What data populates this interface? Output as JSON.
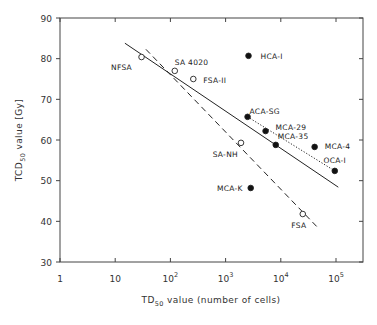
{
  "chart_data": {
    "type": "scatter",
    "title": "",
    "xlabel": "TD50 value (number of cells)",
    "xlabel_main": "TD",
    "xlabel_sub": "50",
    "xlabel_rest": " value (number of cells)",
    "ylabel": "TCD50 value [Gy]",
    "ylabel_main": "TCD",
    "ylabel_sub": "50",
    "ylabel_rest": " value   [Gy]",
    "xscale": "log",
    "xlim": [
      1,
      250000
    ],
    "ylim": [
      30,
      90
    ],
    "grid": false,
    "x_ticks": [
      {
        "value": 1,
        "label": "1",
        "exp": ""
      },
      {
        "value": 10,
        "label": "10",
        "exp": ""
      },
      {
        "value": 100,
        "label": "10",
        "exp": "2"
      },
      {
        "value": 1000,
        "label": "10",
        "exp": "3"
      },
      {
        "value": 10000,
        "label": "10",
        "exp": "4"
      },
      {
        "value": 100000,
        "label": "10",
        "exp": "5"
      }
    ],
    "y_ticks": [
      30,
      40,
      50,
      60,
      70,
      80,
      90
    ],
    "series": [
      {
        "name": "open circles",
        "marker": "open-circle",
        "points": [
          {
            "label": "NFSA",
            "x": 30,
            "y": 80.4
          },
          {
            "label": "SA 4020",
            "x": 120,
            "y": 77.0
          },
          {
            "label": "FSA-II",
            "x": 260,
            "y": 75.0
          },
          {
            "label": "SA-NH",
            "x": 1900,
            "y": 59.3
          },
          {
            "label": "FSA",
            "x": 25000,
            "y": 41.8
          }
        ]
      },
      {
        "name": "filled circles",
        "marker": "filled-circle",
        "points": [
          {
            "label": "HCA-I",
            "x": 2600,
            "y": 80.7
          },
          {
            "label": "ACA-SG",
            "x": 2500,
            "y": 65.7
          },
          {
            "label": "MCA-29",
            "x": 5300,
            "y": 62.2
          },
          {
            "label": "MCA-35",
            "x": 8100,
            "y": 58.8
          },
          {
            "label": "MCA-4",
            "x": 41000,
            "y": 58.3
          },
          {
            "label": "OCA-I",
            "x": 95000,
            "y": 52.4
          },
          {
            "label": "MCA-K",
            "x": 2850,
            "y": 48.2
          }
        ]
      }
    ],
    "lines": [
      {
        "name": "regression all",
        "style": "solid",
        "from": {
          "x": 15,
          "y": 83.8
        },
        "to": {
          "x": 110000,
          "y": 48.4
        }
      },
      {
        "name": "regression open circles",
        "style": "dashed",
        "from": {
          "x": 36,
          "y": 82.3
        },
        "to": {
          "x": 48000,
          "y": 38.3
        }
      },
      {
        "name": "regression filled (ACA-SG to OCA-I)",
        "style": "dotted",
        "from": {
          "x": 2500,
          "y": 65.7
        },
        "to": {
          "x": 95000,
          "y": 52.4
        }
      }
    ]
  }
}
